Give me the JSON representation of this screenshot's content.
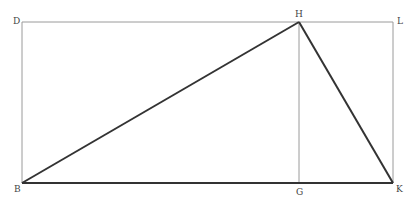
{
  "diagram": {
    "type": "geometric-figure",
    "colors": {
      "background": "#ffffff",
      "construction_line": "#9a9a9a",
      "triangle_line": "#333333",
      "label": "#444444"
    },
    "points": {
      "D": {
        "label": "D",
        "x": 22,
        "y": 22
      },
      "H": {
        "label": "H",
        "x": 299,
        "y": 22
      },
      "L": {
        "label": "L",
        "x": 393,
        "y": 22
      },
      "B": {
        "label": "B",
        "x": 22,
        "y": 183
      },
      "G": {
        "label": "G",
        "x": 299,
        "y": 183
      },
      "K": {
        "label": "K",
        "x": 393,
        "y": 183
      }
    },
    "construction_lines": [
      {
        "from": "D",
        "to": "L"
      },
      {
        "from": "D",
        "to": "B"
      },
      {
        "from": "L",
        "to": "K"
      },
      {
        "from": "H",
        "to": "G"
      }
    ],
    "triangle_lines": [
      {
        "from": "B",
        "to": "H"
      },
      {
        "from": "H",
        "to": "K"
      },
      {
        "from": "B",
        "to": "K"
      }
    ],
    "labels": [
      {
        "text": "D",
        "x": 16,
        "y": 22
      },
      {
        "text": "H",
        "x": 295,
        "y": 17
      },
      {
        "text": "L",
        "x": 397,
        "y": 23
      },
      {
        "text": "B",
        "x": 14,
        "y": 191
      },
      {
        "text": "G",
        "x": 296,
        "y": 194
      },
      {
        "text": "K",
        "x": 396,
        "y": 191
      }
    ]
  }
}
